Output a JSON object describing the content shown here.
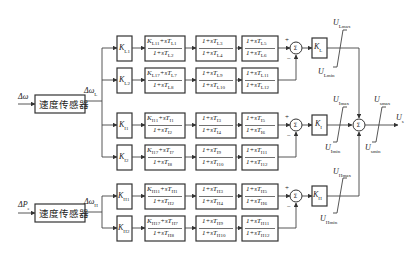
{
  "diagram": {
    "type": "control block diagram (power system stabilizer, dual-input)",
    "inputs": [
      {
        "label": "Δω",
        "sensor": "速度传感器",
        "output": "Δω_L"
      },
      {
        "label": "ΔP_e",
        "sensor": "速度传感器",
        "output": "Δω_H"
      }
    ],
    "gain_blocks": {
      "K_L1": "K_L1",
      "K_L2": "K_L2",
      "K_I1": "K_I1",
      "K_I2": "K_I2",
      "K_H1": "K_H1",
      "K_H2": "K_H2",
      "K_L": "K_L",
      "K_I": "K_I",
      "K_H": "K_H"
    },
    "rows": [
      {
        "gain": "K_L1",
        "tf1": {
          "num": "K_L11 + sT_L1",
          "den": "1 + sT_L2"
        },
        "tf2": {
          "num": "1 + sT_L3",
          "den": "1 + sT_L4"
        },
        "tf3": {
          "num": "1 + sT_L5",
          "den": "1 + sT_L6"
        },
        "sign": "+"
      },
      {
        "gain": "K_L2",
        "tf1": {
          "num": "K_L17 + sT_L7",
          "den": "1 + sT_L8"
        },
        "tf2": {
          "num": "1 + sT_L9",
          "den": "1 + sT_L10"
        },
        "tf3": {
          "num": "1 + sT_L11",
          "den": "1 + sT_L12"
        },
        "sign": "−"
      },
      {
        "gain": "K_I1",
        "tf1": {
          "num": "K_I11 + sT_I1",
          "den": "1 + sT_I2"
        },
        "tf2": {
          "num": "1 + sT_I3",
          "den": "1 + sT_I4"
        },
        "tf3": {
          "num": "1 + sT_I5",
          "den": "1 + sT_I6"
        },
        "sign": "+"
      },
      {
        "gain": "K_I2",
        "tf1": {
          "num": "K_I17 + sT_I7",
          "den": "1 + sT_I8"
        },
        "tf2": {
          "num": "1 + sT_I9",
          "den": "1 + sT_I10"
        },
        "tf3": {
          "num": "1 + sT_I11",
          "den": "1 + sT_I12"
        },
        "sign": "−"
      },
      {
        "gain": "K_H1",
        "tf1": {
          "num": "K_H11 + sT_H1",
          "den": "1 + sT_H2"
        },
        "tf2": {
          "num": "1 + sT_H3",
          "den": "1 + sT_H4"
        },
        "tf3": {
          "num": "1 + sT_H5",
          "den": "1 + sT_H6"
        },
        "sign": "+"
      },
      {
        "gain": "K_H2",
        "tf1": {
          "num": "K_H17 + sT_H7",
          "den": "1 + sT_H8"
        },
        "tf2": {
          "num": "1 + sT_H9",
          "den": "1 + sT_H10"
        },
        "tf3": {
          "num": "1 + sT_H11",
          "den": "1 + sT_H12"
        },
        "sign": "−"
      }
    ],
    "limiters": [
      {
        "max": "U_Lmax",
        "min": "U_Lmin"
      },
      {
        "max": "U_Imax",
        "min": "U_Imin"
      },
      {
        "max": "U_Hmax",
        "min": "U_Hmin"
      },
      {
        "max": "U_smax",
        "min": "U_smin"
      }
    ],
    "output": "U_s"
  },
  "text": {
    "dw": "Δω",
    "dpe": "ΔP",
    "dpe_sub": "e",
    "sensor": "速度传感器",
    "dwL": "Δω",
    "dwL_sub": "L",
    "dwH": "Δω",
    "dwH_sub": "H",
    "U": "U",
    "Lmax": "Lmax",
    "Lmin": "Lmin",
    "Imax": "Imax",
    "Imin": "Imin",
    "Hmax": "Hmax",
    "Hmin": "Hmin",
    "smax": "smax",
    "smin": "smin",
    "Us_sub": "s",
    "plus": "+",
    "minus": "−"
  }
}
